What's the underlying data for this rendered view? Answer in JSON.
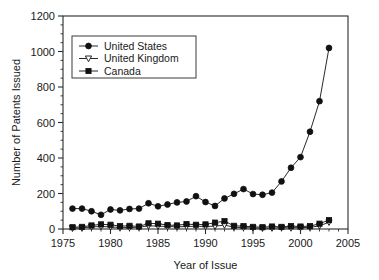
{
  "chart_data": {
    "type": "line",
    "title": "",
    "xlabel": "Year of Issue",
    "ylabel": "Number of Patents Issued",
    "xlim": [
      1975,
      2005
    ],
    "ylim": [
      0,
      1200
    ],
    "xticks": [
      1975,
      1980,
      1985,
      1990,
      1995,
      2000,
      2005
    ],
    "yticks": [
      0,
      200,
      400,
      600,
      800,
      1000,
      1200
    ],
    "xtick_labels": [
      "1975",
      "1980",
      "1985",
      "1990",
      "1995",
      "2000",
      "2005"
    ],
    "ytick_labels": [
      "0",
      "200",
      "400",
      "600",
      "800",
      "1000",
      "1200"
    ],
    "x_minor_tick_step": 1,
    "y_minor_tick_step": 50,
    "grid": false,
    "legend_position": "upper-left",
    "x": [
      1976,
      1977,
      1978,
      1979,
      1980,
      1981,
      1982,
      1983,
      1984,
      1985,
      1986,
      1987,
      1988,
      1989,
      1990,
      1991,
      1992,
      1993,
      1994,
      1995,
      1996,
      1997,
      1998,
      1999,
      2000,
      2001,
      2002,
      2003
    ],
    "series": [
      {
        "name": "United States",
        "marker": "filled-circle",
        "values": [
          115,
          115,
          100,
          80,
          110,
          105,
          113,
          115,
          145,
          128,
          138,
          150,
          155,
          185,
          152,
          130,
          172,
          198,
          225,
          197,
          193,
          205,
          268,
          345,
          405,
          548,
          720,
          1020
        ]
      },
      {
        "name": "United Kingdom",
        "marker": "open-triangle-down",
        "values": [
          5,
          6,
          12,
          14,
          12,
          8,
          8,
          10,
          18,
          16,
          14,
          12,
          14,
          16,
          14,
          16,
          22,
          10,
          8,
          6,
          5,
          6,
          7,
          7,
          8,
          9,
          18,
          38
        ]
      },
      {
        "name": "Canada",
        "marker": "filled-square",
        "values": [
          10,
          12,
          20,
          26,
          24,
          16,
          18,
          14,
          32,
          30,
          22,
          20,
          28,
          24,
          26,
          36,
          44,
          18,
          16,
          12,
          10,
          14,
          12,
          16,
          14,
          16,
          30,
          50
        ]
      }
    ]
  },
  "legend": {
    "entries": [
      {
        "label": "United States"
      },
      {
        "label": "United Kingdom"
      },
      {
        "label": "Canada"
      }
    ]
  },
  "colors": {
    "series": "#111111",
    "axis": "#2b2b2b",
    "background": "#ffffff"
  }
}
